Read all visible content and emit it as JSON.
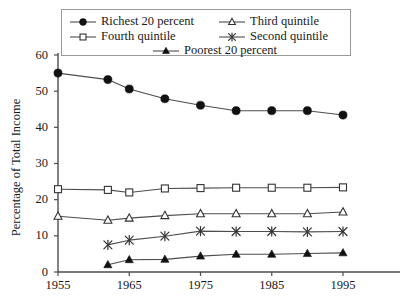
{
  "chart_data": {
    "type": "line",
    "title": "",
    "subtitle": "",
    "xlabel": "",
    "ylabel": "Percentage of Total Income",
    "xlim": [
      1953,
      1998
    ],
    "ylim": [
      0,
      60
    ],
    "grid": false,
    "legend_position": "top",
    "x_ticks": [
      "1955",
      "1965",
      "1975",
      "1985",
      "1995"
    ],
    "x_tick_values": [
      1955,
      1965,
      1975,
      1985,
      1995
    ],
    "y_ticks": [
      "0",
      "10",
      "20",
      "30",
      "40",
      "50",
      "60"
    ],
    "y_tick_values": [
      0,
      10,
      20,
      30,
      40,
      50,
      60
    ],
    "x": [
      1955,
      1962,
      1965,
      1970,
      1975,
      1980,
      1985,
      1990,
      1995
    ],
    "series": [
      {
        "name": "Richest 20 percent",
        "marker": "filled-circle",
        "x": [
          1955,
          1962,
          1965,
          1970,
          1975,
          1980,
          1985,
          1990,
          1995
        ],
        "values": [
          55.0,
          53.2,
          50.6,
          47.9,
          46.1,
          44.6,
          44.6,
          44.6,
          43.4
        ]
      },
      {
        "name": "Fourth quintile",
        "marker": "open-square",
        "x": [
          1955,
          1962,
          1965,
          1970,
          1975,
          1980,
          1985,
          1990,
          1995
        ],
        "values": [
          22.9,
          22.7,
          22.0,
          23.1,
          23.2,
          23.3,
          23.3,
          23.3,
          23.4
        ]
      },
      {
        "name": "Third quintile",
        "marker": "open-triangle",
        "x": [
          1955,
          1962,
          1965,
          1970,
          1975,
          1980,
          1985,
          1990,
          1995
        ],
        "values": [
          15.4,
          14.3,
          14.9,
          15.6,
          16.1,
          16.1,
          16.1,
          16.1,
          16.6
        ]
      },
      {
        "name": "Second quintile",
        "marker": "asterisk",
        "x": [
          1962,
          1965,
          1970,
          1975,
          1980,
          1985,
          1990,
          1995
        ],
        "values": [
          7.5,
          8.8,
          9.9,
          11.3,
          11.2,
          11.2,
          11.1,
          11.2
        ]
      },
      {
        "name": "Poorest 20 percent",
        "marker": "filled-triangle",
        "x": [
          1962,
          1965,
          1970,
          1975,
          1980,
          1985,
          1990,
          1995
        ],
        "values": [
          2.0,
          3.4,
          3.5,
          4.4,
          4.9,
          4.9,
          5.1,
          5.3
        ]
      }
    ]
  },
  "legend": {
    "entries": [
      {
        "label": "Richest 20 percent",
        "marker": "filled-circle"
      },
      {
        "label": "Third quintile",
        "marker": "open-triangle"
      },
      {
        "label": "Fourth quintile",
        "marker": "open-square"
      },
      {
        "label": "Second quintile",
        "marker": "asterisk"
      },
      {
        "label": "Poorest 20 percent",
        "marker": "filled-triangle"
      }
    ]
  },
  "colors": {
    "line": "#4d4d4d",
    "marker_fill": "#111111",
    "marker_stroke": "#333333",
    "axis": "#4d4d4d",
    "legend_border": "#9a9a9a",
    "text": "#1a1a1a",
    "background": "#ffffff"
  }
}
